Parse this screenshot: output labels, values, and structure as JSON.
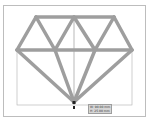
{
  "canvas": {
    "shape_name": "diamond",
    "stroke_color": "#9e9e9e",
    "frame_border_color": "#bdbdbd",
    "guide_color": "#9e9e9e"
  },
  "tooltip": {
    "width_label": "W: 90.00 mm",
    "height_label": "H: 25.00 mm"
  }
}
